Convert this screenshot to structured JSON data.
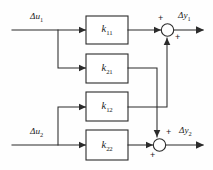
{
  "diagram": {
    "stroke_color": "#2b2b2b",
    "background_color": "#fefefe",
    "inputs": [
      {
        "id": "u1",
        "label_var": "Δu",
        "label_sub": "1"
      },
      {
        "id": "u2",
        "label_var": "Δu",
        "label_sub": "2"
      }
    ],
    "outputs": [
      {
        "id": "y1",
        "label_var": "Δy",
        "label_sub": "1"
      },
      {
        "id": "y2",
        "label_var": "Δy",
        "label_sub": "2"
      }
    ],
    "blocks": [
      {
        "id": "k11",
        "gain": "k",
        "sub": "11"
      },
      {
        "id": "k21",
        "gain": "k",
        "sub": "21"
      },
      {
        "id": "k12",
        "gain": "k",
        "sub": "12"
      },
      {
        "id": "k22",
        "gain": "k",
        "sub": "22"
      }
    ],
    "summing_junctions": [
      {
        "id": "sum1",
        "sign_top": "+",
        "sign_bottom": "+"
      },
      {
        "id": "sum2",
        "sign_top": "+",
        "sign_bottom": "+"
      }
    ]
  }
}
